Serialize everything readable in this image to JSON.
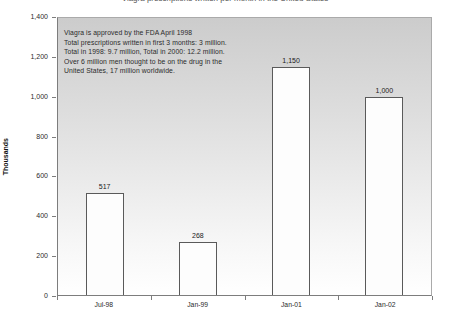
{
  "page": {
    "title_clipped": "Viagra prescriptions written per month in the United States"
  },
  "annotation": {
    "lines": [
      "Viagra is approved by the FDA April 1998",
      "Total prescriptions written in first 3 months: 3 million.",
      "Total in 1998: 9.7 million, Total in 2000: 12.2 million.",
      "Over 6 million men thought to be on the drug in the",
      "United States, 17 million worldwide."
    ]
  },
  "chart_data": {
    "type": "bar",
    "categories": [
      "Jul-98",
      "Jan-99",
      "Jan-01",
      "Jan-02"
    ],
    "values": [
      517,
      268,
      1150,
      1000
    ],
    "data_labels": [
      "517",
      "268",
      "1,150",
      "1,000"
    ],
    "title": "Viagra prescriptions written per month in the United States",
    "xlabel": "",
    "ylabel": "Thousands",
    "ylim": [
      0,
      1400
    ],
    "ytick_step": 200,
    "yticks": [
      "0",
      "200",
      "400",
      "600",
      "800",
      "1,000",
      "1,200",
      "1,400"
    ],
    "grid": false,
    "legend": false,
    "annotation_text": "Viagra is approved by the FDA April 1998. Total prescriptions written in first 3 months: 3 million. Total in 1998: 9.7 million, Total in 2000: 12.2 million. Over 6 million men thought to be on the drug in the United States, 17 million worldwide.",
    "colors": {
      "bar_fill": "#fdfdfd",
      "bar_border": "#5a5a5a",
      "plot_bg_top": "#cccccc",
      "plot_bg_bottom": "#ffffff",
      "axis": "#7d7d7d",
      "text": "#1a1a1a"
    }
  }
}
